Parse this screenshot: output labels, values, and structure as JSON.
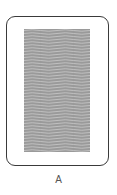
{
  "card": {
    "label": "A",
    "face": "back",
    "pattern": "wavy-lines",
    "colors": {
      "border": "#3a3a3a",
      "pattern_base": "#9a9a9a",
      "pattern_line": "#c4c4c4",
      "background": "#ffffff",
      "label": "#555555"
    }
  }
}
